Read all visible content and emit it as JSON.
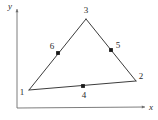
{
  "figure": {
    "kind": "geometry-diagram",
    "background_color": "#ffffff",
    "line_color": "#3c3c3c",
    "axis_color": "#6e6e6e",
    "node_color": "#1a1a1a",
    "label_color": "#2b2b2b"
  },
  "axes": {
    "x_axis": {
      "label": "x",
      "origin": {
        "x": 17,
        "y": 108
      },
      "end": {
        "x": 145,
        "y": 107
      },
      "label_pos": {
        "x": 151,
        "y": 107
      },
      "arrow": true
    },
    "y_axis": {
      "label": "y",
      "origin": {
        "x": 17,
        "y": 108
      },
      "end": {
        "x": 17,
        "y": 9
      },
      "label_pos": {
        "x": 10,
        "y": 6
      },
      "arrow": true
    }
  },
  "chart_data": {
    "type": "scatter",
    "title": "",
    "xlabel": "x",
    "ylabel": "y",
    "grid": false,
    "legend": null,
    "nodes": [
      {
        "id": "1",
        "role": "corner",
        "x": 29,
        "y": 90,
        "label": "1",
        "label_x": 22,
        "label_y": 92,
        "dot": false
      },
      {
        "id": "2",
        "role": "corner",
        "x": 136,
        "y": 81,
        "label": "2",
        "label_x": 141,
        "label_y": 76,
        "dot": false
      },
      {
        "id": "3",
        "role": "corner",
        "x": 86,
        "y": 19,
        "label": "3",
        "label_x": 86,
        "label_y": 10,
        "dot": false
      },
      {
        "id": "4",
        "role": "mid-side",
        "x": 83,
        "y": 86,
        "label": "4",
        "label_x": 84,
        "label_y": 95,
        "dot": true
      },
      {
        "id": "5",
        "role": "mid-side",
        "x": 111,
        "y": 50,
        "label": "5",
        "label_x": 118,
        "label_y": 45,
        "dot": true
      },
      {
        "id": "6",
        "role": "mid-side",
        "x": 58,
        "y": 53,
        "label": "6",
        "label_x": 52,
        "label_y": 46,
        "dot": true
      }
    ],
    "edges": [
      {
        "name": "edge-1-2",
        "from": "1",
        "to": "2",
        "mid_node": "4"
      },
      {
        "name": "edge-2-3",
        "from": "2",
        "to": "3",
        "mid_node": "5"
      },
      {
        "name": "edge-3-1",
        "from": "3",
        "to": "1",
        "mid_node": "6"
      }
    ]
  }
}
